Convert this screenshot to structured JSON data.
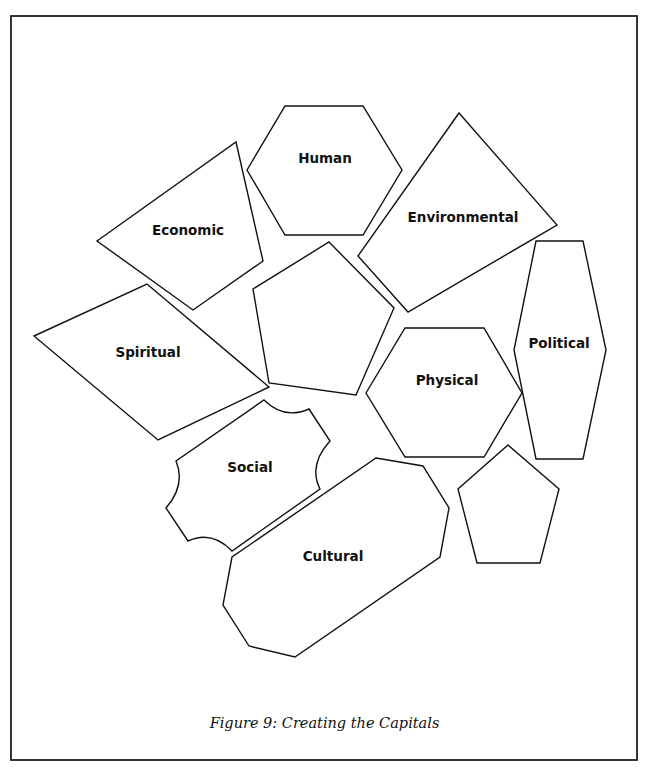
{
  "figure": {
    "caption": "Figure 9: Creating the Capitals",
    "stroke_color": "#111111",
    "fill_color": "#ffffff",
    "border_color": "#333333"
  },
  "shapes": [
    {
      "id": "economic",
      "label": "Economic",
      "type": "quadrilateral"
    },
    {
      "id": "human",
      "label": "Human",
      "type": "hexagon"
    },
    {
      "id": "environmental",
      "label": "Environmental",
      "type": "quadrilateral"
    },
    {
      "id": "blank-pentagon-center",
      "label": "",
      "type": "pentagon"
    },
    {
      "id": "spiritual",
      "label": "Spiritual",
      "type": "rhombus"
    },
    {
      "id": "physical",
      "label": "Physical",
      "type": "hexagon"
    },
    {
      "id": "political",
      "label": "Political",
      "type": "elongated-hexagon"
    },
    {
      "id": "social",
      "label": "Social",
      "type": "puzzle-piece"
    },
    {
      "id": "cultural",
      "label": "Cultural",
      "type": "octagon"
    },
    {
      "id": "blank-pentagon-small",
      "label": "",
      "type": "pentagon"
    }
  ]
}
